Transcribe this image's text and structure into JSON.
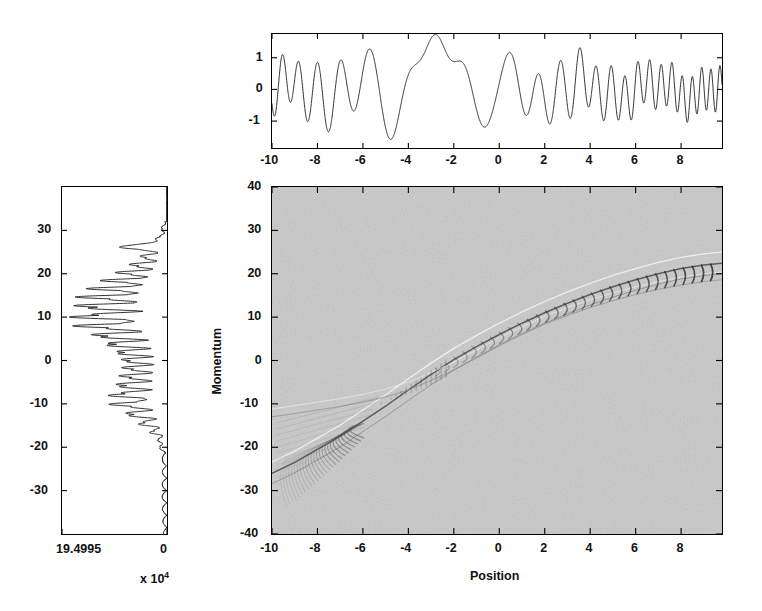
{
  "figure": {
    "background": "#ffffff",
    "ink": "#111111",
    "heatmap_base_color": "#c9c9c9"
  },
  "chart_data": [
    {
      "id": "position-wavefunction",
      "type": "line",
      "title": "",
      "xlabel": "",
      "ylabel": "",
      "xlim": [
        -10,
        9.8
      ],
      "ylim": [
        -1.85,
        1.75
      ],
      "xticks": [
        -10,
        -8,
        -6,
        -4,
        -2,
        0,
        2,
        4,
        6,
        8
      ],
      "xticklabels": [
        "-10",
        "-8",
        "-6",
        "-4",
        "-2",
        "0",
        "2",
        "4",
        "6",
        "8"
      ],
      "yticks": [
        -1,
        0,
        1
      ],
      "yticklabels": [
        "-1",
        "0",
        "1"
      ],
      "grid": false,
      "legend": "none",
      "description": "Real part of a chirped wave packet in position space; fast oscillation at the edges, slow envelope near x=-2",
      "model": {
        "kind": "chirped-wave",
        "amplitude_envelope": 1.45,
        "chirp_center": -2.3,
        "chirp_rate": 1.32,
        "base_frequency": 0.45,
        "modulation_terms": [
          {
            "freq": 0.31,
            "amp": 0.32,
            "phase": 1.1
          },
          {
            "freq": 0.77,
            "amp": 0.22,
            "phase": 2.4
          }
        ]
      }
    },
    {
      "id": "momentum-distribution",
      "type": "line",
      "title": "",
      "xlabel": "",
      "ylabel": "",
      "orientation": "vertical",
      "xlim": [
        19.4995,
        0
      ],
      "ylim": [
        -40,
        40
      ],
      "xticks": [
        19.4995,
        0
      ],
      "xticklabels": [
        "19.4995",
        "0"
      ],
      "x_exponent": "x 10",
      "x_exponent_power": "4",
      "yticks": [
        -30,
        -20,
        -10,
        0,
        10,
        20,
        30
      ],
      "yticklabels": [
        "-30",
        "-20",
        "-10",
        "0",
        "10",
        "20",
        "30"
      ],
      "grid": false,
      "legend": "none",
      "description": "Momentum-space probability density plotted sideways; baseline at right (value 0), peaks extend leftward. Dense oscillatory lobes between p = -20 and p = +25, largest spikes near p = 10-13 and p = -11.",
      "model": {
        "kind": "oscillatory-spectrum",
        "peak_band": [
          -20,
          26
        ],
        "max_amplitude_fraction": 0.97,
        "ripple_count": 58
      }
    },
    {
      "id": "wigner-phase-space",
      "type": "heatmap",
      "title": "",
      "xlabel": "Position",
      "ylabel": "Momentum",
      "xlim": [
        -10,
        9.8
      ],
      "ylim": [
        -40,
        40
      ],
      "xticks": [
        -10,
        -8,
        -6,
        -4,
        -2,
        0,
        2,
        4,
        6,
        8
      ],
      "xticklabels": [
        "-10",
        "-8",
        "-6",
        "-4",
        "-2",
        "0",
        "2",
        "4",
        "6",
        "8"
      ],
      "yticks": [
        -40,
        -30,
        -20,
        -10,
        0,
        10,
        20,
        30,
        40
      ],
      "yticklabels": [
        "-40",
        "-30",
        "-20",
        "-10",
        "0",
        "10",
        "20",
        "30",
        "40"
      ],
      "grid": false,
      "legend": "none",
      "colormap": "gray",
      "description": "Wigner quasi-probability distribution in phase space. A curved classical ridge runs from (-9,-24) up through (-4,-6) and (0,4) to (9,20), bending over at the top right. Interference chevrons fan out along the ridge; a second faint whisker branch extends toward the lower-left.",
      "ridge_points": [
        [
          -10,
          -26
        ],
        [
          -9,
          -23.5
        ],
        [
          -8,
          -20.5
        ],
        [
          -7,
          -17.5
        ],
        [
          -6,
          -14.0
        ],
        [
          -5,
          -10.5
        ],
        [
          -4,
          -6.8
        ],
        [
          -3,
          -3.2
        ],
        [
          -2,
          0.2
        ],
        [
          -1,
          3.2
        ],
        [
          0,
          6.0
        ],
        [
          1,
          8.6
        ],
        [
          2,
          11.0
        ],
        [
          3,
          13.2
        ],
        [
          4,
          15.2
        ],
        [
          5,
          17.0
        ],
        [
          6,
          18.6
        ],
        [
          7,
          20.0
        ],
        [
          8,
          21.2
        ],
        [
          9,
          22.0
        ],
        [
          9.8,
          22.4
        ]
      ],
      "branch_points": [
        [
          -10,
          -13.0
        ],
        [
          -9,
          -12.2
        ],
        [
          -8,
          -11.4
        ],
        [
          -7,
          -10.6
        ],
        [
          -6,
          -9.6
        ],
        [
          -5,
          -8.4
        ],
        [
          -4,
          -6.8
        ],
        [
          -3,
          -4.6
        ],
        [
          -2,
          -2.2
        ],
        [
          -1,
          0.6
        ],
        [
          0,
          3.4
        ],
        [
          1,
          6.0
        ],
        [
          2,
          8.4
        ],
        [
          3,
          10.4
        ],
        [
          4,
          12.2
        ],
        [
          5,
          13.8
        ],
        [
          6,
          15.2
        ],
        [
          7,
          16.4
        ],
        [
          8,
          17.4
        ],
        [
          9,
          18.2
        ],
        [
          9.8,
          18.6
        ]
      ]
    }
  ],
  "panels": {
    "top": {
      "name": "Position wavefunction panel"
    },
    "left": {
      "name": "Momentum distribution panel"
    },
    "main": {
      "name": "Wigner phase-space panel"
    }
  },
  "labels": {
    "position_axis_title": "Position",
    "momentum_axis_title": "Momentum",
    "left_exponent_prefix": "x 10",
    "left_exponent_power": "4",
    "left_x_min_label": "19.4995",
    "left_x_max_label": "0"
  }
}
